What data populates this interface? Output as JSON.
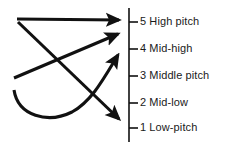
{
  "figure": {
    "name": "pitch-contour-diagram",
    "background_color": "#ffffff",
    "stroke_color": "#111111",
    "text_color": "#1a1a1a",
    "width": 230,
    "height": 147
  },
  "axis": {
    "name": "pitch-scale-axis",
    "x": 129,
    "y_top": 8,
    "y_bottom": 142,
    "tick_length": 9,
    "tick_color": "#111111"
  },
  "scale": {
    "levels": [
      {
        "number": "5",
        "name": "High pitch",
        "label": "5 High pitch",
        "tick_y": 22,
        "label_y": 16
      },
      {
        "number": "4",
        "name": "Mid-high",
        "label": "4 Mid-high",
        "tick_y": 49,
        "label_y": 43
      },
      {
        "number": "3",
        "name": "Middle pitch",
        "label": "3 Middle pitch",
        "tick_y": 76,
        "label_y": 70
      },
      {
        "number": "2",
        "name": "Mid-low",
        "label": "2 Mid-low",
        "tick_y": 103,
        "label_y": 97
      },
      {
        "number": "1",
        "name": "Low-pitch",
        "label": "1 Low-pitch",
        "tick_y": 128,
        "label_y": 122
      }
    ]
  },
  "contours": [
    {
      "name": "level-high-contour",
      "shape": "straight",
      "description": "level horizontal arrow to High pitch",
      "start": {
        "x": 17,
        "y": 19
      },
      "end": {
        "x": 123,
        "y": 20
      },
      "path": "M 17 19 L 119 20",
      "arrow_at": "end"
    },
    {
      "name": "rising-to-mid-high-contour",
      "shape": "straight",
      "description": "rising arrow from middle-left up to Mid-high",
      "start": {
        "x": 14,
        "y": 78
      },
      "end": {
        "x": 122,
        "y": 32
      },
      "path": "M 14 78 L 118 34",
      "arrow_at": "end"
    },
    {
      "name": "falling-to-low-contour",
      "shape": "straight",
      "description": "falling arrow from upper-left down to Low-pitch",
      "start": {
        "x": 18,
        "y": 22
      },
      "end": {
        "x": 124,
        "y": 124
      },
      "path": "M 18 22 L 119 119",
      "arrow_at": "end"
    },
    {
      "name": "dipping-rising-contour",
      "shape": "curved",
      "description": "curved dipping then rising arrow up to Middle pitch",
      "start": {
        "x": 14,
        "y": 90
      },
      "end": {
        "x": 124,
        "y": 52
      },
      "path": "M 14 90 C 18 116, 48 124, 72 112 C 92 101, 104 78, 118 55",
      "arrow_at": "end"
    }
  ]
}
